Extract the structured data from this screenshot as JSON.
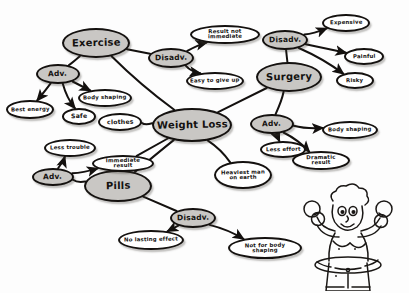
{
  "diagram": {
    "title": "Weight Loss",
    "type": "hand-drawn mind map",
    "colors": {
      "ink": "#14110f",
      "node_fill": "#c9c7c4",
      "node_hollow": "#ffffff",
      "background": "#fdfdfd"
    },
    "nodes": [
      {
        "id": "weight-loss",
        "label": "Weight Loss",
        "style": "filled",
        "size": "big",
        "x": 152,
        "y": 108,
        "w": 80,
        "h": 34
      },
      {
        "id": "exercise",
        "label": "Exercise",
        "style": "filled",
        "size": "big",
        "x": 62,
        "y": 28,
        "w": 68,
        "h": 30
      },
      {
        "id": "surgery",
        "label": "Surgery",
        "style": "filled",
        "size": "big",
        "x": 256,
        "y": 62,
        "w": 66,
        "h": 30
      },
      {
        "id": "pills",
        "label": "Pills",
        "style": "filled",
        "size": "big",
        "x": 84,
        "y": 170,
        "w": 68,
        "h": 32
      },
      {
        "id": "exercise-adv",
        "label": "Adv.",
        "style": "filled",
        "size": "mid",
        "x": 36,
        "y": 64,
        "w": 44,
        "h": 20
      },
      {
        "id": "exercise-disadv",
        "label": "Disadv.",
        "style": "filled",
        "size": "mid",
        "x": 148,
        "y": 48,
        "w": 46,
        "h": 20
      },
      {
        "id": "surgery-disadv",
        "label": "Disadv.",
        "style": "filled",
        "size": "mid",
        "x": 262,
        "y": 30,
        "w": 46,
        "h": 20
      },
      {
        "id": "surgery-adv",
        "label": "Adv.",
        "style": "filled",
        "size": "mid",
        "x": 250,
        "y": 114,
        "w": 44,
        "h": 20
      },
      {
        "id": "pills-adv",
        "label": "Adv.",
        "style": "filled",
        "size": "mid",
        "x": 32,
        "y": 168,
        "w": 42,
        "h": 18
      },
      {
        "id": "pills-disadv",
        "label": "Disadv.",
        "style": "filled",
        "size": "mid",
        "x": 170,
        "y": 208,
        "w": 46,
        "h": 20
      },
      {
        "id": "best-energy",
        "label": "Best energy",
        "style": "hollow",
        "size": "tiny",
        "x": 6,
        "y": 100,
        "w": 48,
        "h": 19
      },
      {
        "id": "safe",
        "label": "Safe",
        "style": "hollow",
        "size": "small",
        "x": 62,
        "y": 108,
        "w": 34,
        "h": 17
      },
      {
        "id": "body-shaping-left",
        "label": "Body shaping",
        "style": "hollow",
        "size": "tiny",
        "x": 78,
        "y": 89,
        "w": 54,
        "h": 18
      },
      {
        "id": "clothes",
        "label": "clothes",
        "style": "hollow",
        "size": "small",
        "x": 98,
        "y": 113,
        "w": 44,
        "h": 18
      },
      {
        "id": "less-trouble",
        "label": "Less trouble",
        "style": "hollow",
        "size": "tiny",
        "x": 44,
        "y": 139,
        "w": 52,
        "h": 18
      },
      {
        "id": "immediate-result",
        "label": "Immediate result",
        "style": "hollow",
        "size": "tiny",
        "x": 92,
        "y": 155,
        "w": 62,
        "h": 17
      },
      {
        "id": "result-not-immediate",
        "label": "Result not immediate",
        "style": "hollow",
        "size": "tiny",
        "x": 190,
        "y": 25,
        "w": 70,
        "h": 19
      },
      {
        "id": "easy-to-give-up",
        "label": "Easy to give up",
        "style": "hollow",
        "size": "tiny",
        "x": 186,
        "y": 72,
        "w": 58,
        "h": 18
      },
      {
        "id": "expensive",
        "label": "Expensive",
        "style": "hollow",
        "size": "tiny",
        "x": 322,
        "y": 14,
        "w": 48,
        "h": 18
      },
      {
        "id": "painful",
        "label": "Painful",
        "style": "hollow",
        "size": "tiny",
        "x": 344,
        "y": 48,
        "w": 40,
        "h": 17
      },
      {
        "id": "risky",
        "label": "Risky",
        "style": "hollow",
        "size": "tiny",
        "x": 336,
        "y": 72,
        "w": 38,
        "h": 17
      },
      {
        "id": "body-shaping-right",
        "label": "Body shaping",
        "style": "hollow",
        "size": "tiny",
        "x": 322,
        "y": 121,
        "w": 56,
        "h": 18
      },
      {
        "id": "less-effort",
        "label": "Less effort",
        "style": "hollow",
        "size": "tiny",
        "x": 260,
        "y": 141,
        "w": 46,
        "h": 17
      },
      {
        "id": "dramatic-result",
        "label": "Dramatic result",
        "style": "hollow",
        "size": "tiny",
        "x": 292,
        "y": 151,
        "w": 58,
        "h": 19
      },
      {
        "id": "heaviest-man-on-earth",
        "label": "Heaviest man on earth",
        "style": "hollow",
        "size": "tiny",
        "x": 214,
        "y": 161,
        "w": 58,
        "h": 28
      },
      {
        "id": "no-lasting-effect",
        "label": "No lasting effect",
        "style": "hollow",
        "size": "tiny",
        "x": 118,
        "y": 230,
        "w": 66,
        "h": 20
      },
      {
        "id": "not-for-body-shaping",
        "label": "Not for body shaping",
        "style": "hollow",
        "size": "tiny",
        "x": 228,
        "y": 237,
        "w": 74,
        "h": 22
      }
    ],
    "edges": [
      {
        "from": "weight-loss",
        "to": "exercise",
        "arrow": false
      },
      {
        "from": "weight-loss",
        "to": "surgery",
        "arrow": false
      },
      {
        "from": "weight-loss",
        "to": "pills",
        "arrow": false
      },
      {
        "from": "weight-loss",
        "to": "clothes",
        "arrow": false
      },
      {
        "from": "weight-loss",
        "to": "immediate-result",
        "arrow": false
      },
      {
        "from": "weight-loss",
        "to": "heaviest-man-on-earth",
        "arrow": false
      },
      {
        "from": "exercise",
        "to": "exercise-adv",
        "arrow": false
      },
      {
        "from": "exercise",
        "to": "exercise-disadv",
        "arrow": false
      },
      {
        "from": "exercise-adv",
        "to": "best-energy",
        "arrow": true
      },
      {
        "from": "exercise-adv",
        "to": "safe",
        "arrow": true
      },
      {
        "from": "exercise-adv",
        "to": "body-shaping-left",
        "arrow": true
      },
      {
        "from": "exercise-disadv",
        "to": "result-not-immediate",
        "arrow": true
      },
      {
        "from": "exercise-disadv",
        "to": "easy-to-give-up",
        "arrow": true
      },
      {
        "from": "surgery",
        "to": "surgery-disadv",
        "arrow": false
      },
      {
        "from": "surgery",
        "to": "surgery-adv",
        "arrow": false
      },
      {
        "from": "surgery-disadv",
        "to": "expensive",
        "arrow": true
      },
      {
        "from": "surgery-disadv",
        "to": "painful",
        "arrow": true
      },
      {
        "from": "surgery-disadv",
        "to": "risky",
        "arrow": true
      },
      {
        "from": "surgery-adv",
        "to": "body-shaping-right",
        "arrow": true
      },
      {
        "from": "surgery-adv",
        "to": "less-effort",
        "arrow": true
      },
      {
        "from": "surgery-adv",
        "to": "dramatic-result",
        "arrow": true
      },
      {
        "from": "pills",
        "to": "pills-adv",
        "arrow": false
      },
      {
        "from": "pills",
        "to": "pills-disadv",
        "arrow": false
      },
      {
        "from": "pills-adv",
        "to": "less-trouble",
        "arrow": true
      },
      {
        "from": "pills-adv",
        "to": "immediate-result",
        "arrow": true
      },
      {
        "from": "pills-disadv",
        "to": "no-lasting-effect",
        "arrow": true
      },
      {
        "from": "pills-disadv",
        "to": "not-for-body-shaping",
        "arrow": true
      }
    ],
    "illustration": {
      "name": "cartoon-person-with-dumbbells-and-hula-hoop",
      "description": "Hand-drawn overweight cartoon figure lifting two dumbbells while wearing a hula hoop"
    }
  }
}
